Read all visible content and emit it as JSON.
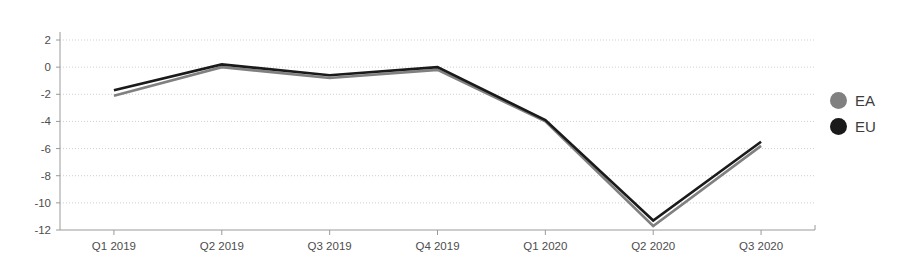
{
  "chart_data": {
    "type": "line",
    "title": "",
    "subtitle": "",
    "xlabel": "",
    "ylabel": "",
    "categories": [
      "Q1 2019",
      "Q2 2019",
      "Q3 2019",
      "Q4 2019",
      "Q1 2020",
      "Q2 2020",
      "Q3 2020"
    ],
    "series": [
      {
        "name": "EA",
        "color": "#808080",
        "values": [
          -2.1,
          0.0,
          -0.8,
          -0.2,
          -4.0,
          -11.7,
          -5.8
        ]
      },
      {
        "name": "EU",
        "color": "#1a1a1a",
        "values": [
          -1.7,
          0.2,
          -0.6,
          0.0,
          -3.9,
          -11.3,
          -5.5
        ]
      }
    ],
    "ylim": [
      -12,
      2
    ],
    "yticks": [
      2,
      0,
      -2,
      -4,
      -6,
      -8,
      -10,
      -12
    ],
    "ytick_labels": [
      "2",
      "0",
      "-2",
      "-4",
      "-6",
      "-8",
      "-10",
      "-12"
    ],
    "grid": true,
    "grid_axis": "y",
    "grid_color": "#cfcfcf",
    "legend_position": "right",
    "background_color": "#ffffff"
  },
  "legend": {
    "items": [
      {
        "label": "EA",
        "color": "#808080",
        "marker": "circle-marker"
      },
      {
        "label": "EU",
        "color": "#1a1a1a",
        "marker": "circle-marker"
      }
    ]
  }
}
